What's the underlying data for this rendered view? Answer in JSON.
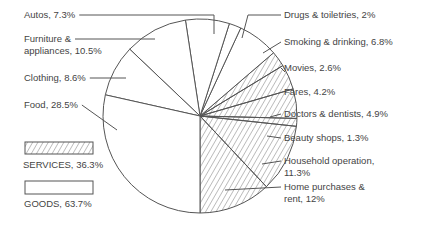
{
  "chart_data": {
    "type": "pie",
    "title": "",
    "start": "bottom",
    "direction": "counterclockwise",
    "slices": [
      {
        "label": "Home purchases & rent",
        "display": [
          "Home purchases &",
          "rent, 12%"
        ],
        "value": 12,
        "group": "SERVICES"
      },
      {
        "label": "Household operation",
        "display": [
          "Household operation,",
          "11.3%"
        ],
        "value": 11.3,
        "group": "SERVICES"
      },
      {
        "label": "Beauty shops",
        "display": [
          "Beauty shops, 1.3%"
        ],
        "value": 1.3,
        "group": "SERVICES"
      },
      {
        "label": "Doctors & dentists",
        "display": [
          "Doctors & dentists, 4.9%"
        ],
        "value": 4.9,
        "group": "SERVICES"
      },
      {
        "label": "Fares",
        "display": [
          "Fares, 4.2%"
        ],
        "value": 4.2,
        "group": "SERVICES"
      },
      {
        "label": "Movies",
        "display": [
          "Movies, 2.6%"
        ],
        "value": 2.6,
        "group": "SERVICES"
      },
      {
        "label": "Smoking & drinking",
        "display": [
          "Smoking & drinking, 6.8%"
        ],
        "value": 6.8,
        "group": "GOODS"
      },
      {
        "label": "Drugs & toiletries",
        "display": [
          "Drugs & toiletries, 2%"
        ],
        "value": 2,
        "group": "GOODS"
      },
      {
        "label": "Autos",
        "display": [
          "Autos, 7.3%"
        ],
        "value": 7.3,
        "group": "GOODS"
      },
      {
        "label": "Furniture & appliances",
        "display": [
          "Furniture &",
          "appliances, 10.5%"
        ],
        "value": 10.5,
        "group": "GOODS"
      },
      {
        "label": "Clothing",
        "display": [
          "Clothing, 8.6%"
        ],
        "value": 8.6,
        "group": "GOODS"
      },
      {
        "label": "Food",
        "display": [
          "Food, 28.5%"
        ],
        "value": 28.5,
        "group": "GOODS"
      }
    ],
    "legend": [
      {
        "label": "SERVICES, 36.3%",
        "group": "SERVICES",
        "value": 36.3,
        "fill": "hatched"
      },
      {
        "label": "GOODS, 63.7%",
        "group": "GOODS",
        "value": 63.7,
        "fill": "white"
      }
    ],
    "legend_position": "left"
  },
  "colors": {
    "line": "#555555",
    "text": "#444444",
    "background": "#ffffff"
  }
}
